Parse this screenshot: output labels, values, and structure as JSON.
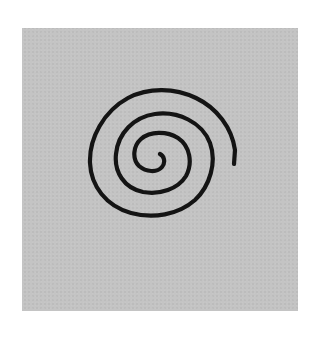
{
  "image": {
    "description": "Hand-drawn black spiral on a gray square background",
    "background_color": "#ffffff",
    "panel_color": "#c4c4c4",
    "stroke_color": "#141414",
    "subject": "spiral",
    "turns": 3
  }
}
